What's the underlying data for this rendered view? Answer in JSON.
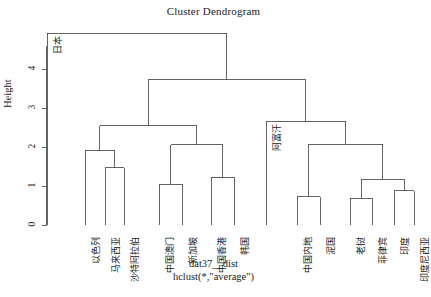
{
  "title": "Cluster Dendrogram",
  "axis": {
    "ylabel": "Height",
    "yticks": [
      "0",
      "1",
      "2",
      "3",
      "4"
    ],
    "ylim": [
      0,
      4.6
    ]
  },
  "xlabel_line1": "dat37__dist",
  "xlabel_line2": "hclust(*,\"average\")",
  "chart_data": {
    "type": "dendrogram",
    "title": "Cluster Dendrogram",
    "xlabel": "dat37__dist / hclust(*,\"average\")",
    "ylabel": "Height",
    "ylim": [
      0,
      4.6
    ],
    "method": "average",
    "grid": false,
    "legend": "none",
    "leaves": [
      {
        "label": "日本",
        "x": 47
      },
      {
        "label": "以色列",
        "x": 85
      },
      {
        "label": "马来西亚",
        "x": 105
      },
      {
        "label": "沙特阿拉伯",
        "x": 124
      },
      {
        "label": "中国澳门",
        "x": 159
      },
      {
        "label": "新加坡",
        "x": 182
      },
      {
        "label": "中国香港",
        "x": 211
      },
      {
        "label": "韩国",
        "x": 234
      },
      {
        "label": "阿富汗",
        "x": 266
      },
      {
        "label": "中国内地",
        "x": 297
      },
      {
        "label": "泥国",
        "x": 320
      },
      {
        "label": "老挝",
        "x": 350
      },
      {
        "label": "菲律宾",
        "x": 372
      },
      {
        "label": "印度",
        "x": 394
      },
      {
        "label": "印度尼西亚",
        "x": 414
      }
    ],
    "merges": [
      {
        "id": "m1",
        "height": 1.47,
        "left_x": 105,
        "right_x": 124,
        "note": "马来西亚 + 沙特阿拉伯"
      },
      {
        "id": "m2",
        "height": 1.91,
        "left_x": 85,
        "right_x": 114.5,
        "note": "以色列 + m1"
      },
      {
        "id": "m3",
        "height": 1.04,
        "left_x": 159,
        "right_x": 182,
        "note": "中国澳门 + 新加坡"
      },
      {
        "id": "m4",
        "height": 1.23,
        "left_x": 211,
        "right_x": 234,
        "note": "中国香港 + 韩国"
      },
      {
        "id": "m5",
        "height": 2.06,
        "left_x": 170.5,
        "right_x": 222.5,
        "note": "m3 + m4"
      },
      {
        "id": "m6",
        "height": 2.55,
        "left_x": 99.75,
        "right_x": 196.5,
        "note": "m2 + m5"
      },
      {
        "id": "m7",
        "height": 0.72,
        "left_x": 297,
        "right_x": 320,
        "note": "中国内地 + 泥国"
      },
      {
        "id": "m8",
        "height": 0.69,
        "left_x": 350,
        "right_x": 372,
        "note": "老挝 + 菲律宾"
      },
      {
        "id": "m9",
        "height": 0.88,
        "left_x": 394,
        "right_x": 414,
        "note": "印度 + 印度尼西亚"
      },
      {
        "id": "m10",
        "height": 1.17,
        "left_x": 361,
        "right_x": 404,
        "note": "m8 + m9"
      },
      {
        "id": "m11",
        "height": 2.07,
        "left_x": 308.5,
        "right_x": 382.5,
        "note": "m7 + m10"
      },
      {
        "id": "m12",
        "height": 2.66,
        "left_x": 266,
        "right_x": 345.5,
        "note": "阿富汗 + m11"
      },
      {
        "id": "m13",
        "height": 3.72,
        "left_x": 148,
        "right_x": 305.75,
        "note": "m6 + m12"
      },
      {
        "id": "m14",
        "height": 4.92,
        "left_x": 47,
        "right_x": 226.9,
        "note": "日本 + m13"
      }
    ]
  }
}
